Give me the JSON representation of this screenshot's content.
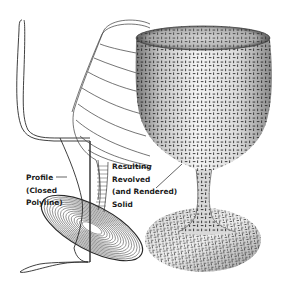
{
  "figure": {
    "colors": {
      "background": "#ffffff",
      "line": "#2a2a2a",
      "solid_light": "#f2f2f2",
      "solid_mid": "#bdbdbd",
      "solid_dark": "#6e6e6e",
      "texture": "#222222"
    }
  },
  "labels": {
    "profile": {
      "lines": [
        "Profile",
        "(Closed",
        "Polyline)"
      ]
    },
    "solid": {
      "lines": [
        "Resulting",
        "Revolved",
        "(and Rendered)",
        "Solid"
      ]
    }
  }
}
